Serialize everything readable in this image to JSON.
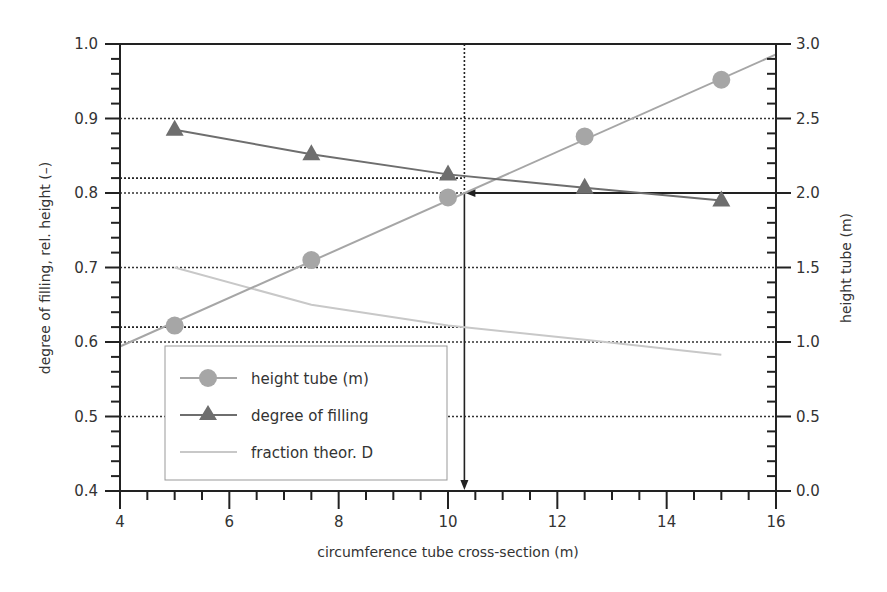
{
  "chart_data": {
    "type": "line",
    "title": "",
    "xlabel": "circumference tube cross-section (m)",
    "ylabel": "degree of filling, rel. height (–)",
    "y2label": "height tube (m)",
    "xlim": [
      4,
      16
    ],
    "ylim": [
      0.4,
      1.0
    ],
    "y2lim": [
      0.0,
      3.0
    ],
    "x_ticks": [
      "4",
      "6",
      "8",
      "10",
      "12",
      "14",
      "16"
    ],
    "y_ticks": [
      "0.4",
      "0.5",
      "0.6",
      "0.7",
      "0.8",
      "0.9",
      "1.0"
    ],
    "y2_ticks": [
      "0.0",
      "0.5",
      "1.0",
      "1.5",
      "2.0",
      "2.5",
      "3.0"
    ],
    "grid": "horizontal dotted at major left ticks",
    "legend_position": "lower left",
    "series": [
      {
        "name": "height tube (m)",
        "axis": "right",
        "marker": "circle",
        "color": "#a6a6a6",
        "x": [
          5,
          7.5,
          10,
          12.5,
          15
        ],
        "values": [
          1.11,
          1.55,
          1.97,
          2.38,
          2.76
        ],
        "line_extent": {
          "x": [
            4,
            16
          ],
          "y": [
            0.97,
            2.93
          ]
        }
      },
      {
        "name": "degree of filling",
        "axis": "left",
        "marker": "triangle",
        "color": "#6e6e6e",
        "x": [
          5,
          7.5,
          10,
          12.5,
          15
        ],
        "values": [
          0.885,
          0.852,
          0.825,
          0.807,
          0.79
        ]
      },
      {
        "name": "fraction theor. D",
        "axis": "left",
        "marker": "none",
        "color": "#c8c8c8",
        "x": [
          5,
          7.5,
          10,
          12.5,
          15
        ],
        "values": [
          0.7,
          0.65,
          0.622,
          0.603,
          0.583
        ]
      }
    ],
    "annotations": [
      {
        "type": "vertical dotted/arrow line",
        "x": 10.3,
        "from": "top",
        "to": "x-axis",
        "arrow": "down"
      },
      {
        "type": "horizontal arrow",
        "y2": 2.0,
        "from_x": 16,
        "to_x": 10.3,
        "arrow": "left"
      },
      {
        "type": "horizontal dotted line",
        "y": 0.82,
        "x_to": 10.3
      },
      {
        "type": "horizontal dotted line",
        "y": 0.62,
        "x_to": 10.3
      }
    ]
  },
  "labels": {
    "xlabel": "circumference tube cross-section (m)",
    "ylabel": "degree of filling, rel. height (–)",
    "y2label": "height tube (m)",
    "legend": [
      "height tube (m)",
      "degree of filling",
      "fraction theor. D"
    ]
  }
}
